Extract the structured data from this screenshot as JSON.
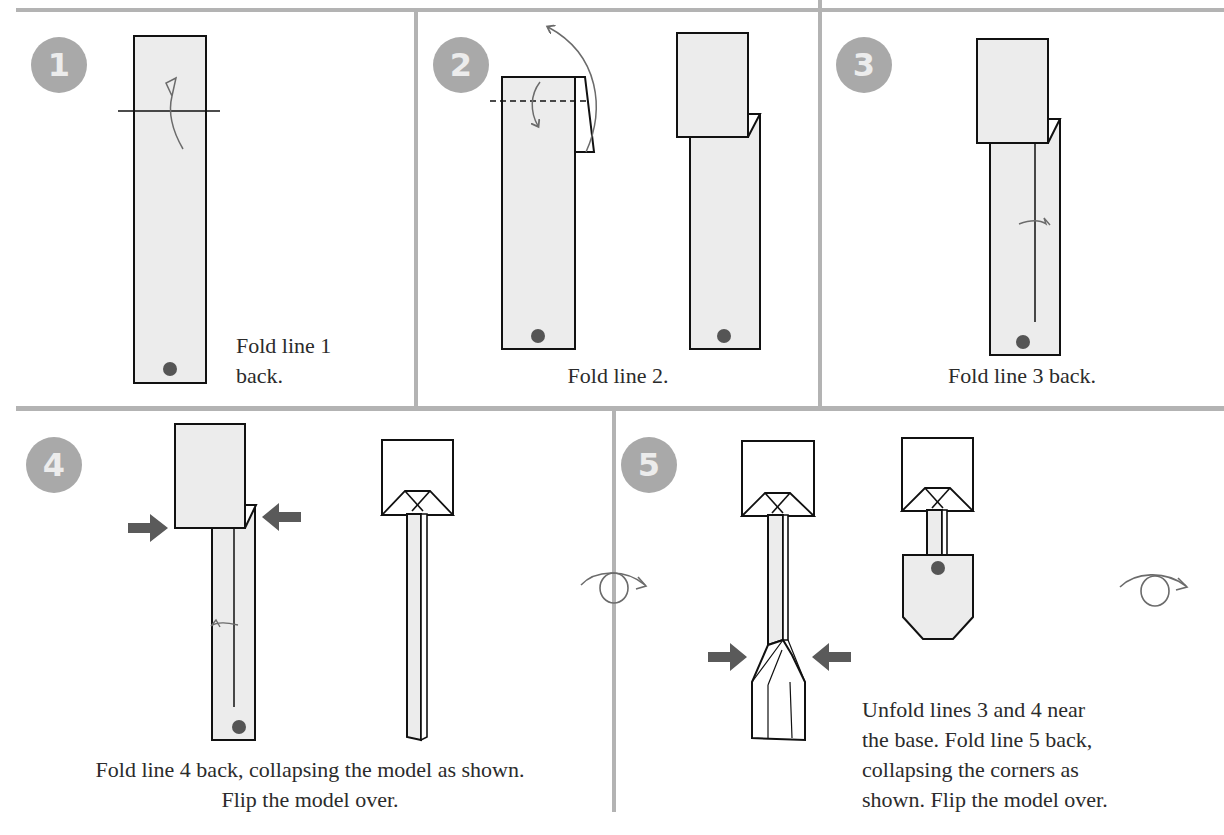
{
  "diagram": {
    "type": "origami-folding-instructions",
    "colors": {
      "divider": "#b3b3b3",
      "badge_bg": "#a9a9a9",
      "badge_text": "#ececec",
      "paper_fill": "#ececec",
      "outline": "#111111",
      "dot": "#555555",
      "push_arrow": "#5a5a5a",
      "fold_arrow": "#6b6b6b"
    },
    "steps": [
      {
        "number": "1",
        "caption_line1": "Fold line 1",
        "caption_line2": "back.",
        "symbols": [
          "mountain-fold-line",
          "fold-arrow",
          "reference-dot"
        ]
      },
      {
        "number": "2",
        "caption_line1": "Fold line 2.",
        "symbols": [
          "valley-fold-dashed-line",
          "fold-arrow",
          "unfold-arrow",
          "reference-dot"
        ]
      },
      {
        "number": "3",
        "caption_line1": "Fold line 3 back.",
        "symbols": [
          "mountain-fold-mark",
          "crease-line",
          "reference-dot"
        ]
      },
      {
        "number": "4",
        "caption_line1": "Fold line 4 back, collapsing the model as shown.",
        "caption_line2": "Flip the model over.",
        "symbols": [
          "push-arrow-right",
          "push-arrow-left",
          "mountain-fold-mark",
          "flip-over-arrow"
        ]
      },
      {
        "number": "5",
        "caption_line1": "Unfold lines 3 and 4 near",
        "caption_line2": "the base. Fold line 5 back,",
        "caption_line3": "collapsing the corners as",
        "caption_line4": "shown. Flip the model over.",
        "symbols": [
          "push-arrow-right",
          "push-arrow-left",
          "reference-dot",
          "flip-over-arrow"
        ]
      }
    ]
  }
}
